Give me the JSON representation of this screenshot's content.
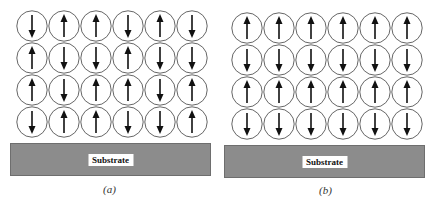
{
  "figure": {
    "panels": [
      {
        "id": "a",
        "caption": "(a)",
        "substrate_label": "Substrate",
        "description": "Random spin orientation",
        "rows": [
          [
            "down",
            "up",
            "up",
            "down",
            "up",
            "down"
          ],
          [
            "up",
            "down",
            "down",
            "up",
            "down",
            "down"
          ],
          [
            "up",
            "down",
            "up",
            "up",
            "down",
            "up"
          ],
          [
            "down",
            "up",
            "up",
            "down",
            "down",
            "up"
          ]
        ]
      },
      {
        "id": "b",
        "caption": "(b)",
        "substrate_label": "Substrate",
        "description": "Alternating layered spin orientation",
        "rows": [
          [
            "up",
            "up",
            "up",
            "up",
            "up",
            "up"
          ],
          [
            "down",
            "down",
            "down",
            "down",
            "down",
            "down"
          ],
          [
            "up",
            "up",
            "up",
            "up",
            "up",
            "up"
          ],
          [
            "down",
            "down",
            "down",
            "down",
            "down",
            "down"
          ]
        ]
      }
    ],
    "colors": {
      "substrate": "#8c8c8c",
      "circle_stroke": "#555555",
      "arrow": "#111111"
    }
  }
}
